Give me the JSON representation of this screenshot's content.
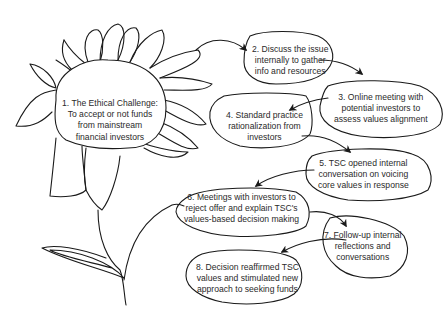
{
  "diagram": {
    "type": "flowchart",
    "style": "hand-drawn flower with speech-bubble ellipses",
    "stroke_color": "#1a1a1a",
    "text_color": "#2a2a2a",
    "nodes": [
      {
        "id": "1",
        "lines": [
          "1. The Ethical Challenge:",
          "To accept or not funds",
          "from mainstream",
          "financial investors"
        ]
      },
      {
        "id": "2",
        "lines": [
          "2. Discuss the issue",
          "internally to gather",
          "info and resources"
        ]
      },
      {
        "id": "3",
        "lines": [
          "3. Online meeting with",
          "potential investors to",
          "assess values alignment"
        ]
      },
      {
        "id": "4",
        "lines": [
          "4. Standard practice",
          "rationalization from",
          "investors"
        ]
      },
      {
        "id": "5",
        "lines": [
          "5. TSC opened internal",
          "conversation on voicing",
          "core values in response"
        ]
      },
      {
        "id": "6",
        "lines": [
          "6. Meetings with investors to",
          "reject offer and explain TSC's",
          "values-based decision making"
        ]
      },
      {
        "id": "7",
        "lines": [
          "7. Follow-up internal",
          "reflections and",
          "conversations"
        ]
      },
      {
        "id": "8",
        "lines": [
          "8. Decision reaffirmed TSC",
          "values and stimulated new",
          "approach to seeking funds"
        ]
      }
    ],
    "edges": [
      {
        "from": "1",
        "to": "2"
      },
      {
        "from": "2",
        "to": "3"
      },
      {
        "from": "3",
        "to": "4"
      },
      {
        "from": "4",
        "to": "5"
      },
      {
        "from": "5",
        "to": "6"
      },
      {
        "from": "6",
        "to": "7"
      },
      {
        "from": "7",
        "to": "8"
      }
    ]
  }
}
